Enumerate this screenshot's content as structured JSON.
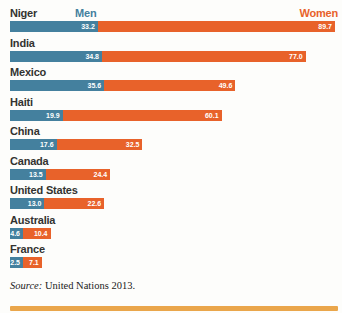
{
  "chart_data": {
    "type": "bar",
    "orientation": "horizontal-stacked",
    "categories": [
      "Niger",
      "India",
      "Mexico",
      "Haiti",
      "China",
      "Canada",
      "United States",
      "Australia",
      "France"
    ],
    "series": [
      {
        "name": "Men",
        "color": "#44809e",
        "values": [
          33.2,
          34.8,
          35.6,
          19.9,
          17.6,
          13.5,
          13.0,
          4.6,
          2.5
        ],
        "labels": [
          "33.2",
          "34.8",
          "35.6",
          "19.9",
          "17.6",
          "13.5",
          "13.0",
          "4.6",
          "2.5"
        ]
      },
      {
        "name": "Women",
        "color": "#e8622a",
        "values": [
          89.7,
          77.0,
          49.6,
          60.1,
          32.5,
          24.4,
          22.6,
          10.4,
          7.1
        ],
        "labels": [
          "89.7",
          "77.0",
          "49.6",
          "60.1",
          "32.5",
          "24.4",
          "22.6",
          "10.4",
          "7.1"
        ]
      }
    ],
    "xlim": [
      0,
      123
    ],
    "grid": false,
    "legend_position": "top",
    "value_label_color": "#ffffff"
  },
  "source": {
    "prefix": "Source:",
    "text": " United Nations 2013."
  },
  "colors": {
    "men": "#44809e",
    "women": "#e8622a",
    "accent_strip": "#eaa64b",
    "country_label": "#333330"
  }
}
